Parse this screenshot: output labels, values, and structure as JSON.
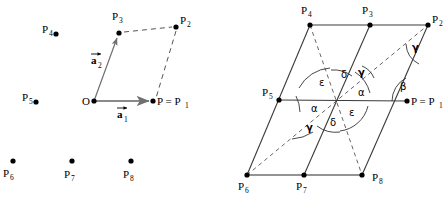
{
  "figure": {
    "colors": {
      "ink": "#000000",
      "vector_gray": "#808080",
      "dashed": "#555555",
      "caption_faint": "#b9b9b9"
    },
    "left_panel": {
      "name": "Primitive cell with basis vectors",
      "origin_label": "O",
      "vectors": [
        {
          "id": "a1",
          "letter": "a",
          "sub": "1",
          "arrow_over": true,
          "style": "solid",
          "color": "#808080"
        },
        {
          "id": "a2",
          "letter": "a",
          "sub": "2",
          "arrow_over": true,
          "style": "solid",
          "color": "#808080"
        }
      ],
      "points": [
        {
          "id": "P1",
          "letter": "P",
          "sub": "1",
          "label": "P = P",
          "x": 153,
          "y": 101,
          "label_x": 157,
          "label_y": 105,
          "label_pos": "right"
        },
        {
          "id": "P2",
          "letter": "P",
          "sub": "2",
          "label": "P",
          "x": 176,
          "y": 27,
          "label_x": 180,
          "label_y": 24,
          "label_pos": "right"
        },
        {
          "id": "P3",
          "letter": "P",
          "sub": "3",
          "label": "P",
          "x": 119,
          "y": 33,
          "label_x": 112,
          "label_y": 20,
          "label_pos": "above"
        },
        {
          "id": "P4",
          "letter": "P",
          "sub": "4",
          "label": "P",
          "x": 56,
          "y": 34,
          "label_x": 42,
          "label_y": 33,
          "label_pos": "left"
        },
        {
          "id": "P5",
          "letter": "P",
          "sub": "5",
          "label": "P",
          "x": 36,
          "y": 102,
          "label_x": 22,
          "label_y": 101,
          "label_pos": "left"
        },
        {
          "id": "P6",
          "letter": "P",
          "sub": "6",
          "label": "P",
          "x": 13,
          "y": 161,
          "label_x": 3,
          "label_y": 177,
          "label_pos": "below-left"
        },
        {
          "id": "P7",
          "letter": "P",
          "sub": "7",
          "label": "P",
          "x": 72,
          "y": 161,
          "label_x": 64,
          "label_y": 178,
          "label_pos": "below"
        },
        {
          "id": "P8",
          "letter": "P",
          "sub": "8",
          "label": "P",
          "x": 131,
          "y": 161,
          "label_x": 123,
          "label_y": 178,
          "label_pos": "below"
        }
      ],
      "origin": {
        "x": 94,
        "y": 101
      },
      "dashed_edges": [
        "P3-P2",
        "P2-P1"
      ]
    },
    "right_panel": {
      "name": "Parallelogram with labelled angles",
      "points": [
        {
          "id": "P1",
          "letter": "P",
          "sub": "1",
          "label": "P = P",
          "x": 407,
          "y": 101,
          "label_x": 411,
          "label_y": 105,
          "label_pos": "right"
        },
        {
          "id": "P2",
          "letter": "P",
          "sub": "2",
          "label": "P",
          "x": 428,
          "y": 25,
          "label_x": 432,
          "label_y": 23,
          "label_pos": "right"
        },
        {
          "id": "P3",
          "letter": "P",
          "sub": "3",
          "label": "P",
          "x": 370,
          "y": 25,
          "label_x": 362,
          "label_y": 14,
          "label_pos": "above"
        },
        {
          "id": "P4",
          "letter": "P",
          "sub": "4",
          "label": "P",
          "x": 310,
          "y": 25,
          "label_x": 301,
          "label_y": 14,
          "label_pos": "above"
        },
        {
          "id": "P5",
          "letter": "P",
          "sub": "5",
          "label": "P",
          "x": 279,
          "y": 100,
          "label_x": 262,
          "label_y": 96,
          "label_pos": "left"
        },
        {
          "id": "P6",
          "letter": "P",
          "sub": "6",
          "label": "P",
          "x": 247,
          "y": 175,
          "label_x": 238,
          "label_y": 190,
          "label_pos": "below-left"
        },
        {
          "id": "P7",
          "letter": "P",
          "sub": "7",
          "label": "P",
          "x": 304,
          "y": 175,
          "label_x": 296,
          "label_y": 190,
          "label_pos": "below"
        },
        {
          "id": "P8",
          "letter": "P",
          "sub": "8",
          "label": "P",
          "x": 362,
          "y": 175,
          "label_x": 372,
          "label_y": 181,
          "label_pos": "right"
        }
      ],
      "center": {
        "x": 336,
        "y": 100
      },
      "solid_edges": [
        "P4-P2",
        "P5-P1",
        "P6-P8",
        "P4-P6",
        "P3-P7",
        "P2-P8"
      ],
      "dashed_edges": [
        "P4-P8",
        "P6-P2"
      ],
      "angles": [
        {
          "symbol": "δ",
          "x": 341,
          "y": 78,
          "where": "center-upper"
        },
        {
          "symbol": "γ",
          "x": 358,
          "y": 76,
          "where": "center-upper-right"
        },
        {
          "symbol": "ε",
          "x": 319,
          "y": 86,
          "where": "center-upper-left"
        },
        {
          "symbol": "α",
          "x": 358,
          "y": 96,
          "where": "center-right"
        },
        {
          "symbol": "α",
          "x": 311,
          "y": 112,
          "where": "center-left"
        },
        {
          "symbol": "ε",
          "x": 349,
          "y": 116,
          "where": "center-lower-right"
        },
        {
          "symbol": "δ",
          "x": 330,
          "y": 126,
          "where": "center-lower"
        },
        {
          "symbol": "γ",
          "x": 306,
          "y": 131,
          "where": "center-lower-left"
        },
        {
          "symbol": "β",
          "x": 400,
          "y": 90,
          "where": "at-P1"
        },
        {
          "symbol": "γ",
          "x": 412,
          "y": 51,
          "where": "at-P2"
        }
      ]
    },
    "captions": {
      "left": "",
      "right": ""
    }
  }
}
